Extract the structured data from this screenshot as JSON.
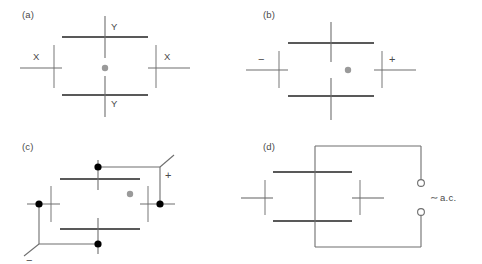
{
  "figure": {
    "colors": {
      "plate_dark": "#595959",
      "plate_light": "#b4b4b4",
      "wire": "#6e6e6e",
      "node_dot": "#000000",
      "center_dot": "#9a9a9a",
      "text": "#4a4a4a",
      "background": "#ffffff"
    }
  },
  "panels": [
    {
      "id": "a",
      "label": "(a)",
      "labels": {
        "top": "Y",
        "bottom": "Y",
        "left": "X",
        "right": "X"
      },
      "center_dot": "beam-spot"
    },
    {
      "id": "b",
      "label": "(b)",
      "labels": {
        "left": "−",
        "right": "+"
      },
      "center_dot": "beam-spot"
    },
    {
      "id": "c",
      "label": "(c)",
      "labels": {
        "positive": "+",
        "negative": "−"
      },
      "center_dot": "beam-spot",
      "junction_count": 5
    },
    {
      "id": "d",
      "label": "(d)",
      "source": {
        "symbol": "∼",
        "name": "a.c.",
        "terminals": 2
      }
    }
  ]
}
